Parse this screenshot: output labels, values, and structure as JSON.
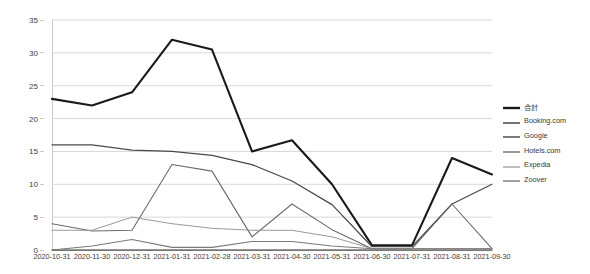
{
  "chart_data": {
    "type": "line",
    "title": "",
    "subtitle": "",
    "xlabel": "",
    "ylabel": "",
    "ylim": [
      0,
      35
    ],
    "ytick_step": 5,
    "yticks": [
      "0",
      "5",
      "10",
      "15",
      "20",
      "25",
      "30",
      "35"
    ],
    "grid": true,
    "legend_position": "right",
    "categories": [
      "2020-10-31",
      "2020-11-30",
      "2020-12-31",
      "2021-01-31",
      "2021-02-28",
      "2021-03-31",
      "2021-04-30",
      "2021-05-31",
      "2021-06-30",
      "2021-07-31",
      "2021-08-31",
      "2021-09-30"
    ],
    "series": [
      {
        "name": "合計",
        "color": "#1a1a1a",
        "width": 2.1,
        "values": [
          23,
          22,
          24,
          32,
          30.5,
          15,
          16.7,
          10,
          0.7,
          0.7,
          14,
          11.5
        ]
      },
      {
        "name": "Booking.com",
        "color": "#4a4a4a",
        "width": 1.25,
        "values": [
          16,
          16,
          15.2,
          15,
          14.4,
          13,
          10.5,
          6.9,
          0.5,
          0.5,
          7,
          10
        ]
      },
      {
        "name": "Google",
        "color": "#555555",
        "width": 1.25,
        "values": [
          0,
          0,
          0,
          0,
          0,
          0,
          0,
          0,
          0,
          0,
          0,
          0
        ]
      },
      {
        "name": "Hotels.com",
        "color": "#6a6a6a",
        "width": 1.1,
        "values": [
          4,
          2.9,
          3,
          13,
          12,
          2,
          7,
          3.1,
          0.2,
          0.2,
          7,
          0.2
        ]
      },
      {
        "name": "Expedia",
        "color": "#9a9a9a",
        "width": 1.0,
        "values": [
          3,
          3,
          5,
          4,
          3.3,
          3,
          3,
          2,
          0.2,
          0.2,
          0.2,
          0.2
        ]
      },
      {
        "name": "Zoover",
        "color": "#7a7a7a",
        "width": 1.1,
        "values": [
          0,
          0.6,
          1.6,
          0.4,
          0.4,
          1.3,
          1.3,
          0.6,
          0.2,
          0.2,
          0.2,
          0.2
        ]
      }
    ]
  },
  "legend": {
    "items": [
      {
        "label": "合計"
      },
      {
        "label": "Booking.com"
      },
      {
        "label": "Google"
      },
      {
        "label": "Hotels.com"
      },
      {
        "label": "Expedia"
      },
      {
        "label": "Zoover"
      }
    ]
  }
}
